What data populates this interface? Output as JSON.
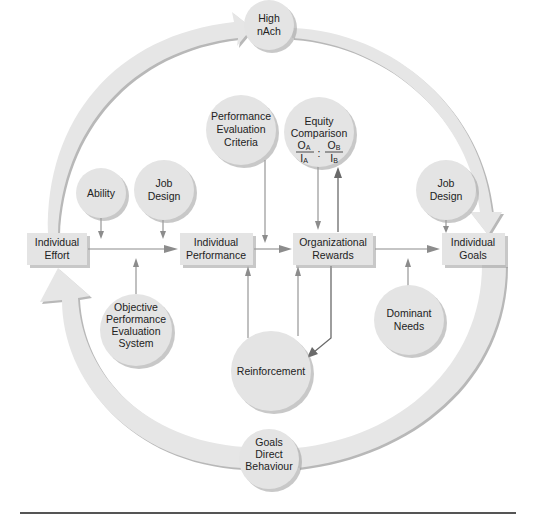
{
  "diagram": {
    "type": "motivation-integration-model",
    "colors": {
      "node_fill": "#e4e4e4",
      "arrow_fill": "#e6e6e6",
      "connector": "#8c8c8c",
      "text": "#222222",
      "rule": "#555555"
    },
    "boxes": {
      "effort": {
        "line1": "Individual",
        "line2": "Effort"
      },
      "performance": {
        "line1": "Individual",
        "line2": "Performance"
      },
      "rewards": {
        "line1": "Organizational",
        "line2": "Rewards"
      },
      "goals": {
        "line1": "Individual",
        "line2": "Goals"
      }
    },
    "circles": {
      "high_nach": {
        "line1": "High",
        "line2": "nAch"
      },
      "perf_eval_criteria": {
        "line1": "Performance",
        "line2": "Evaluation",
        "line3": "Criteria"
      },
      "equity": {
        "line1": "Equity",
        "line2": "Comparison",
        "oa": "O",
        "oa_sub": "A",
        "ia": "I",
        "ia_sub": "A",
        "ob": "O",
        "ob_sub": "B",
        "ib": "I",
        "ib_sub": "B",
        "separator": ":"
      },
      "ability": {
        "line1": "Ability"
      },
      "job_design_left": {
        "line1": "Job",
        "line2": "Design"
      },
      "job_design_right": {
        "line1": "Job",
        "line2": "Design"
      },
      "objective_system": {
        "line1": "Objective",
        "line2": "Performance",
        "line3": "Evaluation",
        "line4": "System"
      },
      "reinforcement": {
        "line1": "Reinforcement"
      },
      "dominant_needs": {
        "line1": "Dominant",
        "line2": "Needs"
      },
      "goals_direct": {
        "line1": "Goals",
        "line2": "Direct",
        "line3": "Behaviour"
      }
    }
  }
}
